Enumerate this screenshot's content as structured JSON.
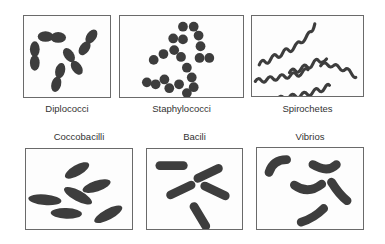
{
  "figure": {
    "panels": [
      {
        "id": "diplococci",
        "label": "Diplococci",
        "shape": "paired cocci"
      },
      {
        "id": "staphylococci",
        "label": "Staphylococci",
        "shape": "clustered cocci"
      },
      {
        "id": "spirochetes",
        "label": "Spirochetes",
        "shape": "spiral"
      },
      {
        "id": "coccobacilli",
        "label": "Coccobacilli",
        "shape": "short oval rods"
      },
      {
        "id": "bacili",
        "label": "Bacili",
        "shape": "rods"
      },
      {
        "id": "vibrios",
        "label": "Vibrios",
        "shape": "curved rods"
      }
    ],
    "colors": {
      "cell_fill": "#3d3d3d",
      "border": "#6a6a6a",
      "text": "#333333"
    }
  }
}
